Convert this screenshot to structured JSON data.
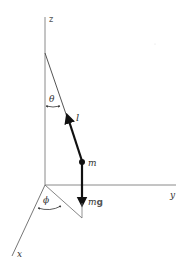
{
  "diagram": {
    "type": "spherical-pendulum",
    "axes": {
      "z_label": "z",
      "y_label": "y",
      "x_label": "x"
    },
    "angles": {
      "polar_label": "θ",
      "azimuthal_label": "ϕ"
    },
    "string": {
      "label": "l"
    },
    "mass": {
      "label": "m"
    },
    "force": {
      "label_m": "m",
      "label_g": "g"
    },
    "colors": {
      "axis": "#888888",
      "string": "#222222",
      "vector": "#111111",
      "text": "#333333"
    }
  }
}
